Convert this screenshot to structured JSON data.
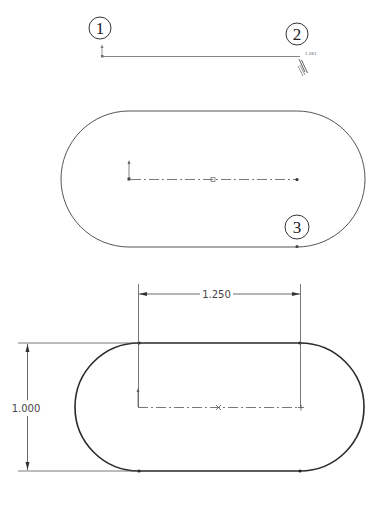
{
  "figure": {
    "colors": {
      "line": "#555555",
      "sketch_line_bold": "#2a2a2a",
      "centerline": "#555555",
      "dimension": "#444444",
      "background": "#ffffff"
    }
  },
  "step1": {
    "callout_1": "1",
    "callout_2": "2",
    "cursor_readout": "1.281",
    "cursor_icon": "slot-pencil-cursor-icon"
  },
  "step2": {
    "callout_3": "3"
  },
  "step3": {
    "dim_horizontal": "1.250",
    "dim_vertical": "1.000"
  }
}
